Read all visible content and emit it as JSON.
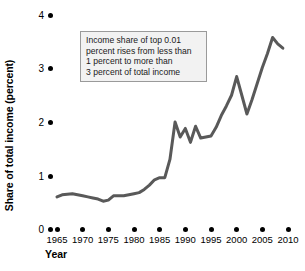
{
  "chart_data": {
    "type": "line",
    "title": "",
    "xlabel": "Year",
    "ylabel": "Share of total income (percent)",
    "xlim": [
      1963,
      2011
    ],
    "ylim": [
      0,
      4
    ],
    "grid": false,
    "legend": null,
    "line_color": "#595959",
    "axis_color": "#000000",
    "xticks": [
      1965,
      1970,
      1975,
      1980,
      1985,
      1990,
      1995,
      2000,
      2005,
      2010
    ],
    "xtick_labels": [
      "1965",
      "1970",
      "1975",
      "1980",
      "1985",
      "1990",
      "1995",
      "2000",
      "2005",
      "2010"
    ],
    "yticks": [
      0,
      1,
      2,
      3,
      4
    ],
    "ytick_labels": [
      "0",
      "1",
      "2",
      "3",
      "4"
    ],
    "series": [
      {
        "name": "Income share of top 0.01 percent",
        "x": [
          1965,
          1966,
          1967,
          1968,
          1969,
          1970,
          1971,
          1972,
          1973,
          1974,
          1975,
          1976,
          1977,
          1978,
          1979,
          1980,
          1981,
          1982,
          1983,
          1984,
          1985,
          1986,
          1987,
          1988,
          1989,
          1990,
          1991,
          1992,
          1993,
          1994,
          1995,
          1996,
          1997,
          1998,
          1999,
          2000,
          2001,
          2002,
          2003,
          2004,
          2005,
          2006,
          2007,
          2008,
          2009
        ],
        "values": [
          0.6,
          0.64,
          0.65,
          0.66,
          0.64,
          0.62,
          0.6,
          0.58,
          0.56,
          0.52,
          0.54,
          0.62,
          0.62,
          0.62,
          0.64,
          0.66,
          0.68,
          0.74,
          0.82,
          0.92,
          0.96,
          0.96,
          1.3,
          2.0,
          1.72,
          1.88,
          1.62,
          1.92,
          1.7,
          1.72,
          1.74,
          1.9,
          2.12,
          2.3,
          2.5,
          2.85,
          2.5,
          2.15,
          2.42,
          2.72,
          3.02,
          3.28,
          3.58,
          3.46,
          3.38
        ]
      }
    ],
    "annotations": [
      {
        "name": "callout",
        "lines": [
          "Income share of top 0.01",
          "percent rises from less than",
          "1 percent to more than",
          "3 percent of total income"
        ]
      }
    ]
  }
}
